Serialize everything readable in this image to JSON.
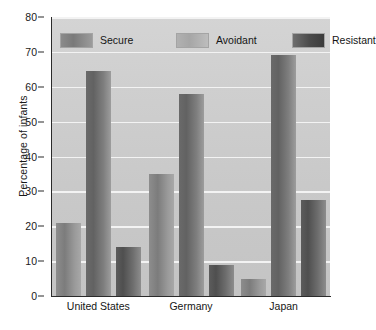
{
  "chart_data": {
    "type": "bar",
    "title": "",
    "xlabel": "",
    "ylabel": "Percentage of infants",
    "ylim": [
      0,
      80
    ],
    "ytick_step": 10,
    "yticks": [
      0,
      10,
      20,
      30,
      40,
      50,
      60,
      70,
      80
    ],
    "grid": "horizontal",
    "legend_position": "top-inside",
    "categories": [
      "United States",
      "Germany",
      "Japan"
    ],
    "series": [
      {
        "name": "Secure",
        "values": [
          21,
          35,
          5
        ],
        "color": "#7c7c7c"
      },
      {
        "name": "Avoidant",
        "values": [
          64.5,
          58,
          69
        ],
        "color": "#626262"
      },
      {
        "name": "Resistant",
        "values": [
          14,
          9,
          27.5
        ],
        "color": "#4f4f4f"
      }
    ]
  },
  "legend": {
    "items": [
      {
        "label": "Secure",
        "swatch": "secure-swatch"
      },
      {
        "label": "Avoidant",
        "swatch": "avoidant-swatch"
      },
      {
        "label": "Resistant",
        "swatch": "resistant-swatch"
      }
    ]
  },
  "axes": {
    "y_title": "Percentage of infants",
    "y_tick_labels": [
      "0",
      "10",
      "20",
      "30",
      "40",
      "50",
      "60",
      "70",
      "80"
    ],
    "x_tick_labels": [
      "United States",
      "Germany",
      "Japan"
    ]
  },
  "caption_sliver": ""
}
